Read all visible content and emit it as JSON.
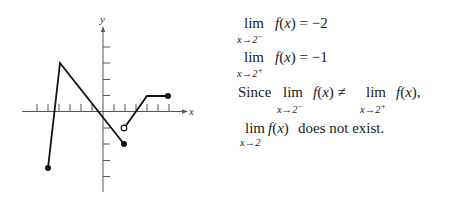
{
  "chart_data": {
    "type": "line",
    "title": "",
    "xlabel": "x",
    "ylabel": "y",
    "x_ticks": [
      -6,
      -5,
      -4,
      -3,
      -2,
      -1,
      1,
      2,
      3,
      4,
      5,
      6
    ],
    "y_ticks": [
      -4,
      -3,
      -2,
      -1,
      1,
      2,
      3,
      4
    ],
    "grid": false,
    "tick_labels_shown": false,
    "series": [
      {
        "name": "f(x) left piece",
        "points": [
          [
            -5,
            -3.5
          ],
          [
            -4,
            3
          ],
          [
            2,
            -2
          ]
        ],
        "endpoints": [
          {
            "x": -5,
            "y": -3.5,
            "style": "closed"
          },
          {
            "x": 2,
            "y": -2,
            "style": "closed"
          }
        ]
      },
      {
        "name": "f(x) right piece",
        "points": [
          [
            2,
            -1
          ],
          [
            4,
            1
          ],
          [
            6,
            1
          ]
        ],
        "endpoints": [
          {
            "x": 2,
            "y": -1,
            "style": "open"
          },
          {
            "x": 6,
            "y": 1,
            "style": "closed"
          }
        ]
      }
    ]
  },
  "graph": {
    "x_axis_label": "x",
    "y_axis_label": "y"
  },
  "text": {
    "line1": {
      "lim": "lim",
      "sub": "x→2",
      "sub_sup": "−",
      "expr": "f(x) = −2"
    },
    "line2": {
      "lim": "lim",
      "sub": "x→2",
      "sub_sup": "+",
      "expr": "f(x) = −1"
    },
    "line3": {
      "since": "Since",
      "lim1": "lim",
      "sub1": "x→2",
      "sub1_sup": "−",
      "expr1": "f(x) ≠",
      "lim2": "lim",
      "sub2": "x→2",
      "sub2_sup": "+",
      "expr2": "f(x),"
    },
    "line4": {
      "lim": "lim",
      "sub": "x→2",
      "expr_fx": "f(x)",
      "conclusion": "does not exist."
    }
  }
}
